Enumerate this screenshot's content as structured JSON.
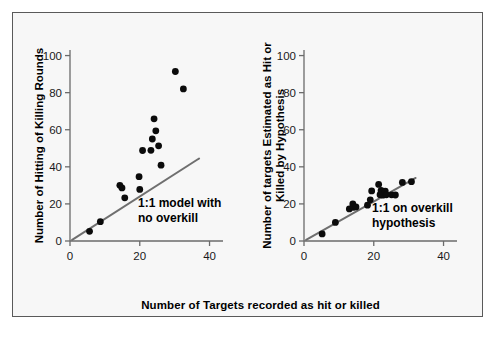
{
  "figure": {
    "background_color": "#f7f7f7",
    "border_color": "#5a5a5a",
    "point_color": "#0b0b0b",
    "line_color": "#6f6f6f",
    "shared_xlabel": "Number of Targets recorded as hit or killed"
  },
  "chart_data": [
    {
      "type": "scatter",
      "panel": "left",
      "title": "",
      "xlabel": "Number of Targets recorded as hit or killed",
      "ylabel": "Number of Hitting of Killing Rounds",
      "ylabel_lines": [
        "Number of Hitting of Killing Rounds"
      ],
      "xlim": [
        0,
        43
      ],
      "ylim": [
        0,
        103
      ],
      "xticks": [
        0,
        20,
        40
      ],
      "yticks": [
        0,
        20,
        40,
        60,
        80,
        100
      ],
      "grid": false,
      "legend": false,
      "annotations": [
        {
          "text_lines": [
            "1:1 model with",
            "no overkill"
          ],
          "x": 19.5,
          "y": 18.5
        }
      ],
      "reference_line": {
        "label": "1:1 model with no overkill",
        "x": [
          0.6,
          37.0
        ],
        "y": [
          0.6,
          44.5
        ]
      },
      "points": [
        {
          "x": 5.6,
          "y": 5.2
        },
        {
          "x": 8.7,
          "y": 10.4
        },
        {
          "x": 14.3,
          "y": 30.0
        },
        {
          "x": 14.9,
          "y": 28.6
        },
        {
          "x": 15.7,
          "y": 23.3
        },
        {
          "x": 19.8,
          "y": 34.7
        },
        {
          "x": 20.0,
          "y": 27.8
        },
        {
          "x": 20.8,
          "y": 48.8
        },
        {
          "x": 23.2,
          "y": 48.9
        },
        {
          "x": 23.6,
          "y": 55.0
        },
        {
          "x": 24.1,
          "y": 65.9
        },
        {
          "x": 24.6,
          "y": 59.4
        },
        {
          "x": 25.4,
          "y": 51.3
        },
        {
          "x": 26.1,
          "y": 40.9
        },
        {
          "x": 30.2,
          "y": 91.4
        },
        {
          "x": 32.5,
          "y": 82.0
        }
      ]
    },
    {
      "type": "scatter",
      "panel": "right",
      "title": "",
      "xlabel": "Number of Targets recorded as hit or killed",
      "ylabel": "Number of targets Estimated as Hit or Killed by Hypothesis",
      "ylabel_lines": [
        "Number of targets Estimated as Hit or",
        "Killed by Hypothesis"
      ],
      "xlim": [
        0,
        43
      ],
      "ylim": [
        0,
        103
      ],
      "xticks": [
        0,
        20,
        40
      ],
      "yticks": [
        0,
        20,
        40,
        60,
        80,
        100
      ],
      "grid": false,
      "legend": false,
      "annotations": [
        {
          "text_lines": [
            "1:1 on overkill",
            "hypothesis"
          ],
          "x": 19.5,
          "y": 15.5
        }
      ],
      "reference_line": {
        "label": "1:1 on overkill hypothesis",
        "x": [
          0.6,
          32.0
        ],
        "y": [
          0.6,
          34.0
        ]
      },
      "points": [
        {
          "x": 5.2,
          "y": 3.8
        },
        {
          "x": 9.0,
          "y": 10.0
        },
        {
          "x": 13.0,
          "y": 17.3
        },
        {
          "x": 14.0,
          "y": 20.0
        },
        {
          "x": 14.2,
          "y": 18.2
        },
        {
          "x": 14.9,
          "y": 18.4
        },
        {
          "x": 18.2,
          "y": 19.3
        },
        {
          "x": 19.0,
          "y": 22.2
        },
        {
          "x": 19.4,
          "y": 27.0
        },
        {
          "x": 21.4,
          "y": 30.5
        },
        {
          "x": 21.8,
          "y": 25.0
        },
        {
          "x": 22.1,
          "y": 27.3
        },
        {
          "x": 22.3,
          "y": 26.4
        },
        {
          "x": 22.6,
          "y": 24.7
        },
        {
          "x": 23.3,
          "y": 26.9
        },
        {
          "x": 23.6,
          "y": 24.9
        },
        {
          "x": 25.1,
          "y": 24.9
        },
        {
          "x": 26.2,
          "y": 24.8
        },
        {
          "x": 28.2,
          "y": 31.6
        },
        {
          "x": 30.8,
          "y": 32.0
        }
      ]
    }
  ]
}
